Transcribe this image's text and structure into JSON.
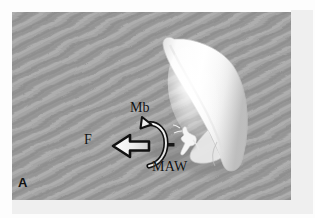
{
  "figure": {
    "panel_letter": "A",
    "caption_type": "scientific-figure-panel",
    "background": {
      "description": "grey rippled sand substrate",
      "base_color": "#9e9e9e",
      "ripple_light": "#b4b4b4",
      "ripple_dark": "#8a8a8a"
    },
    "subject": {
      "name": "bivalve-shell",
      "fill_color": "#fdfdfd",
      "shadow_color": "#8f8f8f",
      "description": "elongated white shell inclined from upper-left to lower-right"
    },
    "organism": {
      "name": "small-white-organism",
      "fill_color": "#f2f2f2",
      "description": "small pale animal at the shell aperture"
    },
    "marker": {
      "name": "scale-dash",
      "color": "#151515"
    },
    "annotations": [
      {
        "id": "force-arrow",
        "label": "F",
        "icon": "left-arrow-icon",
        "description": "thick block arrow pointing left",
        "fill_color": "#f0f0f0",
        "stroke_color": "#111111"
      },
      {
        "id": "moment-arrow",
        "label": "Mb",
        "icon": "curved-arrow-icon",
        "description": "counter-clockwise curved arrow, arrowhead at top",
        "fill_color": "#f0f0f0",
        "stroke_color": "#111111"
      },
      {
        "id": "maw-label",
        "label": "MAW",
        "icon": "text-label",
        "description": "label for the mantle/aperture region"
      }
    ]
  },
  "labels": {
    "mb": "Mb",
    "f": "F",
    "maw": "MAW",
    "panel": "A"
  },
  "colors": {
    "panel_background": "#9e9e9e",
    "mat": "#efefef",
    "page": "#ffffff",
    "ink": "#111111",
    "shell": "#fdfdfd"
  }
}
